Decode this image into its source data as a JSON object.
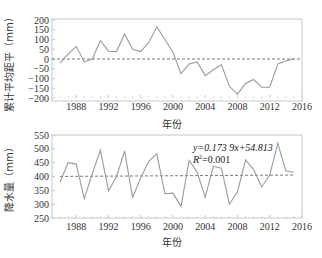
{
  "chart_data": [
    {
      "type": "line",
      "title": "",
      "xlabel": "年份",
      "ylabel": "累计平均距平（mm）",
      "xlim": [
        1985,
        2016
      ],
      "ylim": [
        -200,
        200
      ],
      "xticks": [
        "1988",
        "1992",
        "1996",
        "2000",
        "2004",
        "2008",
        "2012",
        "2016"
      ],
      "yticks": [
        "200",
        "150",
        "100",
        "50",
        "0",
        "-50",
        "-100",
        "-150",
        "-200"
      ],
      "grid": false,
      "reference_line": {
        "y": 0,
        "style": "dashed"
      },
      "x": [
        1986,
        1987,
        1988,
        1989,
        1990,
        1991,
        1992,
        1993,
        1994,
        1995,
        1996,
        1997,
        1998,
        1999,
        2000,
        2001,
        2002,
        2003,
        2004,
        2005,
        2006,
        2007,
        2008,
        2009,
        2010,
        2011,
        2012,
        2013,
        2014,
        2015
      ],
      "series": [
        {
          "name": "累计平均距平",
          "values": [
            -20,
            25,
            65,
            -15,
            0,
            95,
            40,
            38,
            128,
            50,
            38,
            85,
            165,
            100,
            35,
            -75,
            -25,
            -15,
            -85,
            -55,
            -30,
            -140,
            -180,
            -125,
            -105,
            -145,
            -145,
            -25,
            -10,
            0
          ]
        }
      ]
    },
    {
      "type": "line",
      "title": "",
      "xlabel": "年份",
      "ylabel": "降水量（mm）",
      "xlim": [
        1985,
        2016
      ],
      "ylim": [
        250,
        550
      ],
      "xticks": [
        "1988",
        "1992",
        "1996",
        "2000",
        "2004",
        "2008",
        "2012",
        "2016"
      ],
      "yticks": [
        "550",
        "500",
        "450",
        "400",
        "350",
        "300",
        "250"
      ],
      "grid": false,
      "trendline": {
        "equation": "y=0.173 9x+54.813",
        "r2": "R²=0.001",
        "style": "dashed"
      },
      "x": [
        1986,
        1987,
        1988,
        1989,
        1990,
        1991,
        1992,
        1993,
        1994,
        1995,
        1996,
        1997,
        1998,
        1999,
        2000,
        2001,
        2002,
        2003,
        2004,
        2005,
        2006,
        2007,
        2008,
        2009,
        2010,
        2011,
        2012,
        2013,
        2014,
        2015
      ],
      "series": [
        {
          "name": "降水量",
          "values": [
            380,
            450,
            445,
            320,
            410,
            495,
            348,
            400,
            492,
            325,
            395,
            455,
            482,
            338,
            340,
            292,
            458,
            415,
            325,
            437,
            430,
            300,
            345,
            460,
            425,
            362,
            405,
            520,
            420,
            415
          ]
        }
      ]
    }
  ],
  "labels": {
    "top_ylabel": "累计平均距平（mm）",
    "bottom_ylabel": "降水量（mm）",
    "xlabel": "年份",
    "equation": "y=0.173 9x+54.813",
    "r2_prefix": "R",
    "r2_rest": "=0.001"
  },
  "colors": {
    "line": "#9a9a9a",
    "dashed": "#555555",
    "axis": "#bbbbbb",
    "text": "#333333"
  }
}
